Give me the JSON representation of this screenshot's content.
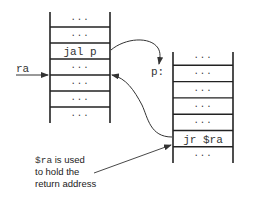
{
  "left_stack": {
    "cells": [
      "...",
      "...",
      "jal p",
      "...",
      "...",
      "...",
      "..."
    ]
  },
  "right_stack": {
    "cells": [
      "...",
      "...",
      "...",
      "...",
      "...",
      "jr $ra",
      "..."
    ]
  },
  "labels": {
    "ra": "ra",
    "p": "p:"
  },
  "annotation": {
    "code": "$ra",
    "line1_rest": " is used",
    "line2": "to hold the",
    "line3": "return address"
  }
}
